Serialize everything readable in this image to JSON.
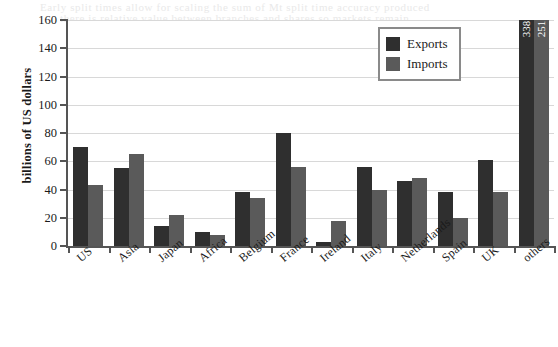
{
  "artifacts": {
    "top_line_1": "Early split times allow for scaling the sum of Mt split time accuracy produced",
    "top_line_2": "there is relative value between branches and shares so markets remain",
    "bottom_smudge": "                "
  },
  "legend": {
    "position": "inside-top-right",
    "items": [
      {
        "label": "Exports",
        "color": "#2f2f2f",
        "name": "exports"
      },
      {
        "label": "Imports",
        "color": "#5a5a5a",
        "name": "imports"
      }
    ]
  },
  "chart_data": {
    "type": "bar",
    "title": "",
    "xlabel": "",
    "ylabel": "billions of US dollars",
    "ylim": [
      0,
      160
    ],
    "yticks": [
      0,
      20,
      40,
      60,
      80,
      100,
      120,
      140,
      160
    ],
    "grid": true,
    "categories": [
      "US",
      "Asia",
      "Japan",
      "Africa",
      "Belgium",
      "France",
      "Ireland",
      "Italy",
      "Netherlands",
      "Spain",
      "UK",
      "others"
    ],
    "series": [
      {
        "name": "Exports",
        "color": "#2f2f2f",
        "values": [
          70,
          55,
          14,
          10,
          38,
          80,
          3,
          56,
          46,
          38,
          61,
          338
        ],
        "labels": [
          "",
          "",
          "",
          "",
          "",
          "",
          "",
          "",
          "",
          "",
          "",
          "338"
        ]
      },
      {
        "name": "Imports",
        "color": "#5a5a5a",
        "values": [
          43,
          65,
          22,
          8,
          34,
          56,
          18,
          40,
          48,
          20,
          38,
          251
        ],
        "labels": [
          "",
          "",
          "",
          "",
          "",
          "",
          "",
          "",
          "",
          "",
          "",
          "251"
        ]
      }
    ]
  }
}
